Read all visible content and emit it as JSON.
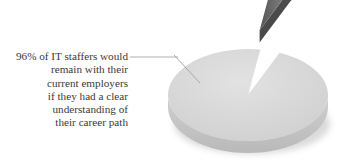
{
  "chart_data": {
    "type": "pie",
    "style": "3d-exploded",
    "title": "",
    "slices": [
      {
        "label": "Would remain with current employer",
        "value": 96,
        "color": "#d8d8d8",
        "edge_color": "#c4c4c4"
      },
      {
        "label": "Would not remain",
        "value": 4,
        "color": "#6e6e6e",
        "edge_color": "#4a4a4a",
        "exploded": true
      }
    ],
    "annotation": {
      "target_slice": 0,
      "lines": [
        "96% of IT staffers would",
        "remain with their",
        "current employers",
        "if they had a clear",
        "understanding of",
        "their career path"
      ]
    },
    "legend": "none"
  }
}
